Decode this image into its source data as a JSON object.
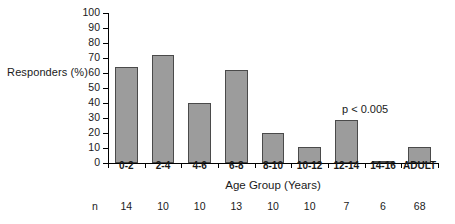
{
  "chart_data": {
    "type": "bar",
    "title": "",
    "subtitle": "",
    "xlabel": "Age Group (Years)",
    "ylabel": "Responders (%)",
    "categories": [
      "0-2",
      "2-4",
      "4-6",
      "6-8",
      "8-10",
      "10-12",
      "12-14",
      "14-16",
      "ADULT"
    ],
    "values": [
      64,
      72,
      40,
      62,
      20,
      11,
      29,
      0.5,
      11
    ],
    "ylim": [
      0,
      100
    ],
    "ytick_labels": [
      "100",
      "90",
      "80",
      "70",
      "60",
      "50",
      "40",
      "30",
      "20",
      "10",
      "0"
    ],
    "ytick_values": [
      100,
      90,
      80,
      70,
      60,
      50,
      40,
      30,
      20,
      10,
      0
    ],
    "grid": false,
    "legend": null,
    "annotations": [
      {
        "text": "p < 0.005",
        "x_category": "14-16",
        "y_value": 37
      }
    ],
    "sample_size_row": {
      "label": "n",
      "values": [
        "14",
        "10",
        "10",
        "13",
        "10",
        "10",
        "7",
        "6",
        "68"
      ]
    },
    "colors": {
      "bar_fill": "#9c9c9c",
      "bar_edge": "#4a4a4a",
      "axis": "#000000",
      "text": "#1a1a1a",
      "background": "#ffffff"
    }
  }
}
